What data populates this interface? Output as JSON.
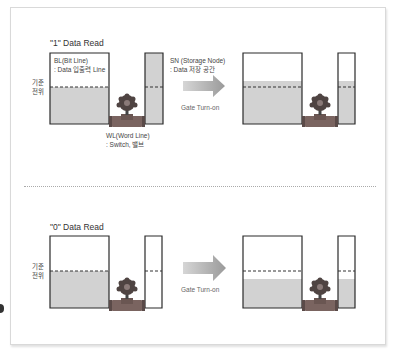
{
  "colors": {
    "tank_outline": "#2a2a2a",
    "fill": "#d2d2d2",
    "dashed_line": "#333333",
    "arrow": "#b5b5b5",
    "valve_wheel": "#5a4a48",
    "valve_pipe": "#7a6460"
  },
  "top_section": {
    "title": "\"1\" Data Read",
    "reference_label": "기준\n전위",
    "bl_label": "BL(Bit Line)\n: Data 입출력 Line",
    "sn_label": "SN (Storage Node)\n: Data 저장 공간",
    "wl_label": "WL(Word Line)\n: Switch, 밸브",
    "gate_label": "Gate Turn-on",
    "arrow_icon": "right-arrow"
  },
  "bottom_section": {
    "title": "\"0\" Data Read",
    "reference_label": "기준\n전위",
    "gate_label": "Gate Turn-on",
    "arrow_icon": "right-arrow"
  },
  "diagrams": [
    {
      "name": "one-before",
      "big_fill_top": 87,
      "small_fill_top": 53,
      "dashed": 87
    },
    {
      "name": "one-after",
      "big_fill_top": 81,
      "small_fill_top": 81,
      "dashed": 87
    },
    {
      "name": "zero-before",
      "big_fill_top": 271,
      "small_fill_top": 308,
      "dashed": 271
    },
    {
      "name": "zero-after",
      "big_fill_top": 279,
      "small_fill_top": 279,
      "dashed": 271
    }
  ]
}
